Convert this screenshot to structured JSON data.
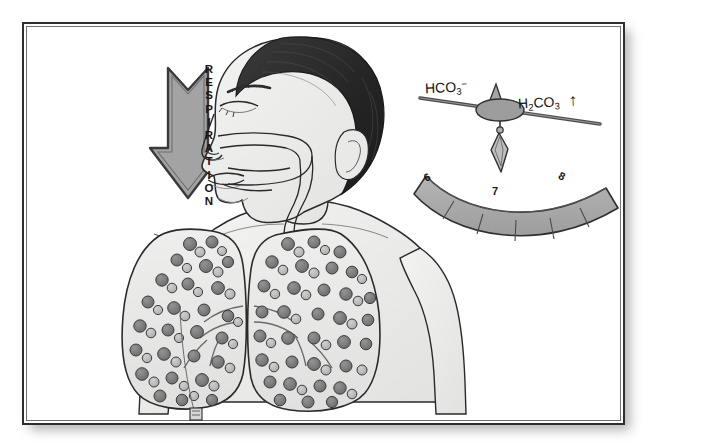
{
  "figure": {
    "frame": {
      "border_color": "#2e2e2e",
      "background": "#ffffff"
    }
  },
  "respiration_arrow": {
    "label": "RESPIRATION",
    "letters": [
      "R",
      "E",
      "S",
      "P",
      "I",
      "R",
      "A",
      "T",
      "I",
      "O",
      "N"
    ],
    "direction": "down",
    "fill_color": "#a3a3a3",
    "outline_color": "#3a3a3a"
  },
  "balance": {
    "left_label": "HCO",
    "left_sub": "3",
    "left_sup": "−",
    "right_label": "H",
    "right_sub1": "2",
    "right_label2": "CO",
    "right_sub2": "3",
    "trend_arrow": "↑",
    "fulcrum_fill": "#9d9d9d",
    "beam_color": "#4a4a4a",
    "tilt": "left-high"
  },
  "ph_scale": {
    "ticks": [
      "6",
      "7",
      "8"
    ],
    "segment_count": 6,
    "arc_fill": "#a9a9a9",
    "arc_outline": "#2f2f2f"
  },
  "anatomy": {
    "head": "profile-head-facing-left",
    "hair_color": "#2b2b2b",
    "skin_color": "#efefee",
    "airway": "nasal-pharyngeal-passage",
    "trachea": "cartilage-ringed-trachea",
    "lungs": "paired-lungs-with-gas-molecules",
    "molecule_dark": "#787878",
    "molecule_light": "#b6b6b6",
    "outline_color": "#2a2a2a"
  }
}
